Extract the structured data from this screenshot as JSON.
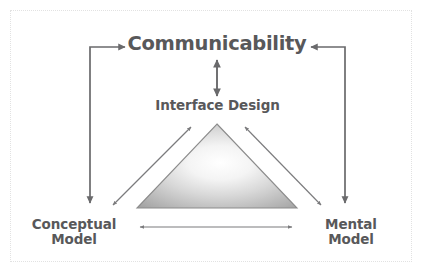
{
  "diagram": {
    "title": "Communicability",
    "type": "conceptual-relationship-diagram",
    "nodes": {
      "communicability": "Communicability",
      "interface_design": "Interface Design",
      "conceptual_model": "Conceptual\nModel",
      "mental_model": "Mental\nModel"
    },
    "shape": {
      "name": "triangle",
      "fill_highlight": "#ffffff",
      "fill_shadow": "#a3a3a3",
      "stroke": "#8c8c8c"
    },
    "connectors": [
      {
        "name": "conceptual-to-communicability",
        "style": "elbow",
        "arrows": "both-ends"
      },
      {
        "name": "mental-to-communicability",
        "style": "elbow",
        "arrows": "both-ends"
      },
      {
        "name": "communicability-interface-design",
        "style": "vertical",
        "arrows": "double"
      },
      {
        "name": "conceptual-to-interface-design",
        "style": "diagonal",
        "arrows": "double"
      },
      {
        "name": "mental-to-interface-design",
        "style": "diagonal",
        "arrows": "double"
      },
      {
        "name": "conceptual-to-mental",
        "style": "horizontal",
        "arrows": "double"
      }
    ],
    "colors": {
      "text": "#58585a",
      "line_heavy": "#6a6a6c",
      "line_thin": "#7b7b7d",
      "frame": "#e2e2e2",
      "background": "#ffffff"
    }
  }
}
